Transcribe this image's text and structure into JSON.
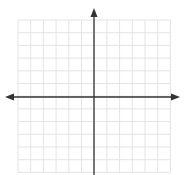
{
  "diagram": {
    "type": "coordinate-plane",
    "grid": {
      "columns": 12,
      "rows": 12,
      "x_start": 18,
      "y_start": 20,
      "cell_size": 12.7,
      "line_color": "#e4e4e4"
    },
    "axes": {
      "color": "#333333",
      "x_axis": {
        "y": 97,
        "x_from": 5,
        "x_to": 180,
        "arrows": [
          "left",
          "right"
        ]
      },
      "y_axis": {
        "x": 94,
        "y_from": 8,
        "y_to": 175,
        "arrows": [
          "up"
        ]
      }
    },
    "labels": []
  }
}
